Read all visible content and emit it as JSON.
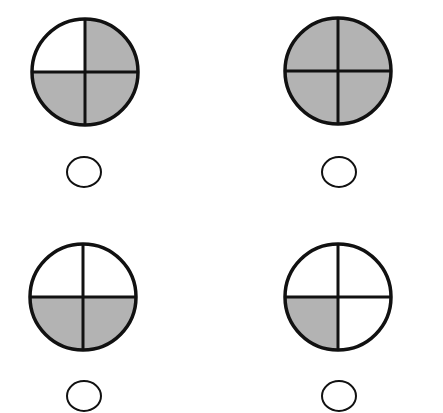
{
  "colors": {
    "shaded": "#b3b3b3",
    "unshaded": "#ffffff",
    "stroke": "#111111"
  },
  "figures": [
    {
      "id": "top-left",
      "cx": 85,
      "cy": 72,
      "r": 53,
      "quadrants": {
        "top_left": false,
        "top_right": true,
        "bottom_left": true,
        "bottom_right": true
      },
      "shaded_count": 3,
      "answer_bubble": {
        "cx": 84,
        "cy": 172,
        "rx": 17,
        "ry": 15,
        "selected": false
      }
    },
    {
      "id": "top-right",
      "cx": 338,
      "cy": 71,
      "r": 53,
      "quadrants": {
        "top_left": true,
        "top_right": true,
        "bottom_left": true,
        "bottom_right": true
      },
      "shaded_count": 4,
      "answer_bubble": {
        "cx": 339,
        "cy": 172,
        "rx": 17,
        "ry": 15,
        "selected": false
      }
    },
    {
      "id": "bottom-left",
      "cx": 83,
      "cy": 297,
      "r": 53,
      "quadrants": {
        "top_left": false,
        "top_right": false,
        "bottom_left": true,
        "bottom_right": true
      },
      "shaded_count": 2,
      "answer_bubble": {
        "cx": 84,
        "cy": 396,
        "rx": 17,
        "ry": 15,
        "selected": false
      }
    },
    {
      "id": "bottom-right",
      "cx": 338,
      "cy": 297,
      "r": 53,
      "quadrants": {
        "top_left": false,
        "top_right": false,
        "bottom_left": true,
        "bottom_right": false
      },
      "shaded_count": 1,
      "answer_bubble": {
        "cx": 339,
        "cy": 396,
        "rx": 17,
        "ry": 15,
        "selected": false
      }
    }
  ]
}
